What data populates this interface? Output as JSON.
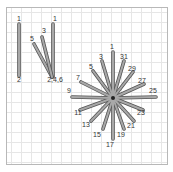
{
  "diagram": {
    "left_stitch": {
      "labels": [
        {
          "text": "1",
          "x": 19,
          "y": 21
        },
        {
          "text": "1",
          "x": 55,
          "y": 21
        },
        {
          "text": "3",
          "x": 44,
          "y": 33
        },
        {
          "text": "5",
          "x": 32,
          "y": 41
        },
        {
          "text": "2",
          "x": 19,
          "y": 82
        },
        {
          "text": "2,4,6",
          "x": 55,
          "y": 82
        }
      ]
    },
    "star_stitch": {
      "center": {
        "x": 113,
        "y": 98
      },
      "labels": [
        {
          "text": "1",
          "x": 112,
          "y": 49
        },
        {
          "text": "3",
          "x": 101,
          "y": 59
        },
        {
          "text": "31",
          "x": 124,
          "y": 59
        },
        {
          "text": "5",
          "x": 91,
          "y": 69
        },
        {
          "text": "29",
          "x": 132,
          "y": 71
        },
        {
          "text": "7",
          "x": 78,
          "y": 80
        },
        {
          "text": "27",
          "x": 142,
          "y": 83
        },
        {
          "text": "9",
          "x": 69,
          "y": 93
        },
        {
          "text": "25",
          "x": 153,
          "y": 93
        },
        {
          "text": "11",
          "x": 78,
          "y": 115
        },
        {
          "text": "23",
          "x": 141,
          "y": 115
        },
        {
          "text": "13",
          "x": 86,
          "y": 127
        },
        {
          "text": "21",
          "x": 131,
          "y": 128
        },
        {
          "text": "15",
          "x": 97,
          "y": 137
        },
        {
          "text": "19",
          "x": 121,
          "y": 137
        },
        {
          "text": "17",
          "x": 110,
          "y": 147
        }
      ]
    },
    "colors": {
      "thread": "#9a9a9a",
      "thread_edge": "#555555",
      "grid": "#e6e6e6",
      "frame": "#b8b8b8"
    }
  }
}
